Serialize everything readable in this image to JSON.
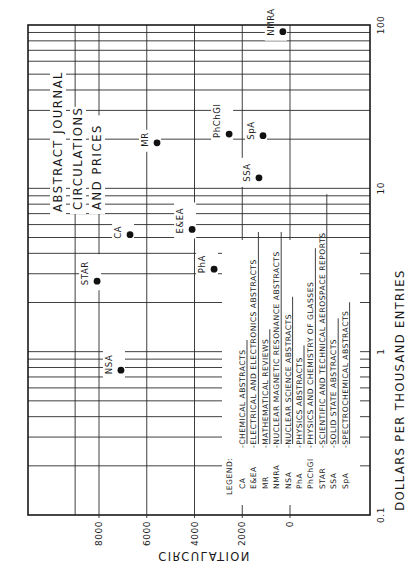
{
  "chart_data": {
    "type": "scatter",
    "title_lines": [
      "ABSTRACT  JOURNAL",
      "CIRCULATIONS",
      "AND  PRICES"
    ],
    "orientation": "rotated 90 degrees counter-clockwise",
    "xlabel": "DOLLARS PER THOUSAND ENTRIES",
    "ylabel": "CIRCULATION",
    "x_scale": "log",
    "xlim": [
      0.1,
      100
    ],
    "ylim": [
      0,
      9200
    ],
    "x_ticks": [
      {
        "value": 0.1,
        "label": "0.1"
      },
      {
        "value": 1,
        "label": "1"
      },
      {
        "value": 10,
        "label": "10"
      },
      {
        "value": 100,
        "label": "100"
      }
    ],
    "y_ticks": [
      {
        "value": 0,
        "label": "0"
      },
      {
        "value": 2000,
        "label": "2000"
      },
      {
        "value": 4000,
        "label": "4000"
      },
      {
        "value": 6000,
        "label": "6000"
      },
      {
        "value": 8000,
        "label": "8000"
      }
    ],
    "grid": true,
    "points": [
      {
        "label": "NMRA",
        "x": 91,
        "y": 300
      },
      {
        "label": "MR",
        "x": 19,
        "y": 5570
      },
      {
        "label": "PhChGl",
        "x": 21.5,
        "y": 2550
      },
      {
        "label": "SpA",
        "x": 21,
        "y": 1130
      },
      {
        "label": "SSA",
        "x": 11.6,
        "y": 1300
      },
      {
        "label": "CA",
        "x": 5.2,
        "y": 6700
      },
      {
        "label": "E&EA",
        "x": 5.6,
        "y": 4100
      },
      {
        "label": "STAR",
        "x": 2.7,
        "y": 8080
      },
      {
        "label": "PhA",
        "x": 3.2,
        "y": 3180
      },
      {
        "label": "NSA",
        "x": 0.77,
        "y": 7080
      }
    ],
    "legend": {
      "heading": "LEGEND:",
      "placement": "bottom-right",
      "entries": [
        {
          "abbr": "CA",
          "name": "CHEMICAL  ABSTRACTS"
        },
        {
          "abbr": "E&EA",
          "name": "ELECTRICAL  AND  ELECTRONICS  ABSTRACTS"
        },
        {
          "abbr": "MR",
          "name": "MATHEMATICAL  REVIEWS"
        },
        {
          "abbr": "NMRA",
          "name": "NUCLEAR  MAGNETIC  RESONANCE  ABSTRACTS"
        },
        {
          "abbr": "NSA",
          "name": "NUCLEAR  SCIENCE  ABSTRACTS"
        },
        {
          "abbr": "PhA",
          "name": "PHYSICS  ABSTRACTS"
        },
        {
          "abbr": "PhChGl",
          "name": "PHYSICS  AND  CHEMISTRY  OF  GLASSES"
        },
        {
          "abbr": "STAR",
          "name": "SCIENTIFIC  AND  TECHNICAL  AEROSPACE  REPORTS"
        },
        {
          "abbr": "SSA",
          "name": "SOLID  STATE  ABSTRACTS"
        },
        {
          "abbr": "SpA",
          "name": "SPECTROCHEMICAL  ABSTRACTS"
        }
      ]
    }
  }
}
